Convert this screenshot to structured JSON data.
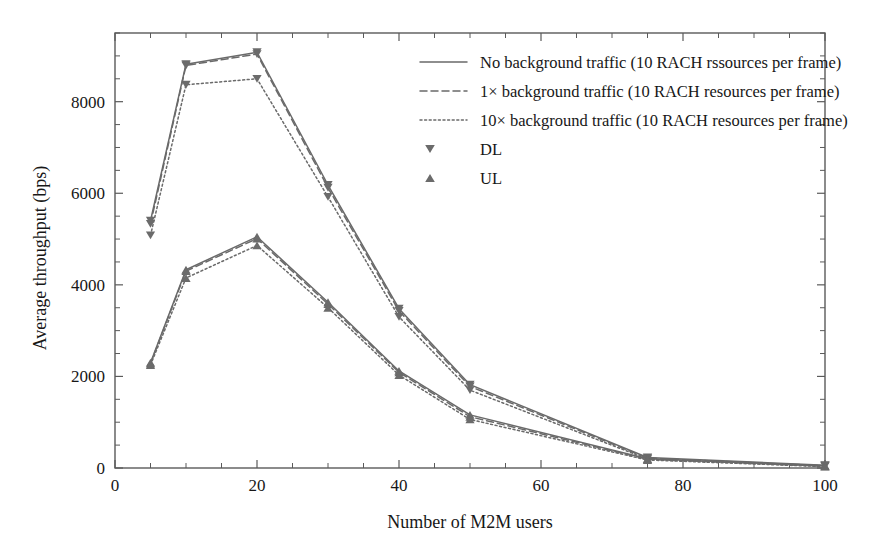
{
  "chart_data": {
    "type": "line",
    "title": "",
    "xlabel": "Number of M2M users",
    "ylabel": "Average throughput (bps)",
    "xlim": [
      0,
      100
    ],
    "ylim": [
      0,
      9500
    ],
    "xticks": [
      0,
      20,
      40,
      60,
      80,
      100
    ],
    "xtick_labels": [
      "0",
      "20",
      "40",
      "60",
      "80",
      "100"
    ],
    "xminor_step": 5,
    "yticks": [
      0,
      2000,
      4000,
      6000,
      8000
    ],
    "ytick_labels": [
      "0",
      "2000",
      "4000",
      "6000",
      "8000"
    ],
    "yminor_step": 500,
    "grid": false,
    "legend_position": "upper right",
    "x": [
      5,
      10,
      20,
      30,
      40,
      50,
      75,
      100
    ],
    "series": [
      {
        "name": "DL - No background traffic",
        "link": "DL",
        "style": "solid",
        "marker": "triangle-down",
        "values": [
          5400,
          8820,
          9080,
          6180,
          3480,
          1820,
          230,
          60
        ]
      },
      {
        "name": "DL - 1x background traffic",
        "link": "DL",
        "style": "dashed",
        "marker": "triangle-down",
        "values": [
          5330,
          8790,
          9040,
          6120,
          3430,
          1780,
          215,
          50
        ]
      },
      {
        "name": "DL - 10x background traffic",
        "link": "DL",
        "style": "dotted",
        "marker": "triangle-down",
        "values": [
          5080,
          8370,
          8500,
          5920,
          3300,
          1700,
          195,
          40
        ]
      },
      {
        "name": "UL - No background traffic",
        "link": "UL",
        "style": "solid",
        "marker": "triangle-up",
        "values": [
          2300,
          4330,
          5050,
          3620,
          2120,
          1160,
          200,
          45
        ]
      },
      {
        "name": "UL - 1x background traffic",
        "link": "UL",
        "style": "dashed",
        "marker": "triangle-up",
        "values": [
          2280,
          4300,
          5010,
          3580,
          2090,
          1120,
          190,
          38
        ]
      },
      {
        "name": "UL - 10x background traffic",
        "link": "UL",
        "style": "dotted",
        "marker": "triangle-up",
        "values": [
          2250,
          4150,
          4860,
          3500,
          2030,
          1060,
          175,
          30
        ]
      }
    ],
    "legend": [
      {
        "label": "No background traffic (10 RACH rssources per frame)",
        "kind": "line",
        "style": "solid"
      },
      {
        "label": "1× background traffic (10 RACH resources per frame)",
        "kind": "line",
        "style": "dashed"
      },
      {
        "label": "10× background traffic (10 RACH resources per frame)",
        "kind": "line",
        "style": "dotted"
      },
      {
        "label": "DL",
        "kind": "marker",
        "style": "triangle-down"
      },
      {
        "label": "UL",
        "kind": "marker",
        "style": "triangle-up"
      }
    ],
    "colors": {
      "line": "#6a6a6a",
      "axis": "#5a5a5a",
      "text": "#171717",
      "background": "#ffffff"
    }
  }
}
